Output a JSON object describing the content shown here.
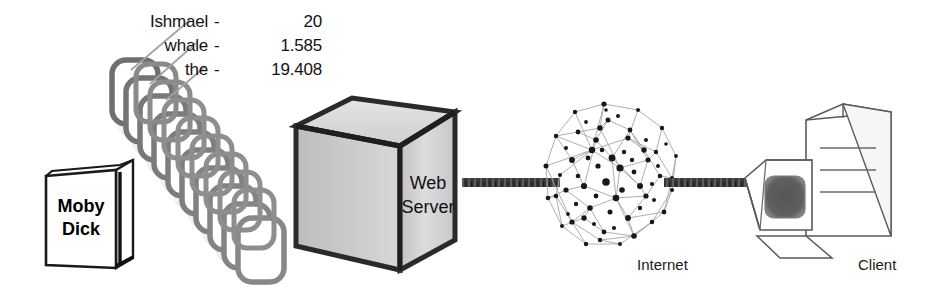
{
  "diagram": {
    "background_color": "#ffffff"
  },
  "book": {
    "title_line1": "Moby",
    "title_line2": "Dick",
    "cover_color": "#ffffff",
    "outline_color": "#111111"
  },
  "index_terms": {
    "heading": "",
    "rows": [
      {
        "term": "Ishmael",
        "separator": "-",
        "count": "20"
      },
      {
        "term": "whale",
        "separator": "-",
        "count": "1.585"
      },
      {
        "term": "the",
        "separator": "-",
        "count": "19.408"
      }
    ]
  },
  "pages": {
    "label": "document pages",
    "count": 12,
    "color": "#7d7d7d"
  },
  "server": {
    "label_line1": "Web",
    "label_line2": "Server",
    "face_color": "#d2d2d2",
    "outline_color": "#262626"
  },
  "internet": {
    "label": "Internet",
    "node_color": "#1c1c1c",
    "edge_color": "#9a9a9a"
  },
  "client": {
    "label": "Client",
    "screen_color": "#5d5d5d",
    "case_color": "#ffffff",
    "outline_color": "#555555"
  },
  "links": {
    "server_to_internet": "network-link",
    "internet_to_client": "network-link",
    "color": "#3a3a3a"
  },
  "leader_lines": {
    "color": "#9a9a9a",
    "count": 3
  }
}
